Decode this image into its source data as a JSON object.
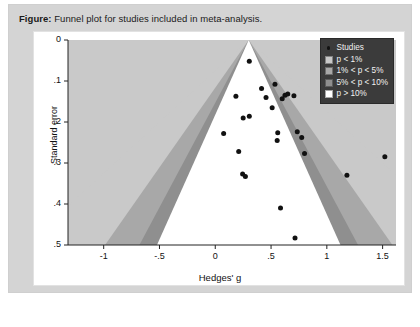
{
  "caption": {
    "label": "Figure:",
    "text": " Funnel plot for studies included in meta-analysis."
  },
  "colors": {
    "card_background": "#d4d4d4",
    "panel_background": "#ffffff",
    "band_p_lt_1": "#c9c9c9",
    "band_1_to_5": "#a8a8a8",
    "band_5_to_10": "#8f8f8f",
    "band_p_gt_10": "#ffffff",
    "point": "#111111",
    "legend_background": "#3b3b3b",
    "axis": "#222222"
  },
  "legend": {
    "position": "top-right",
    "entries": [
      {
        "label": "Studies",
        "swatch": "marker"
      },
      {
        "label": "p < 1%",
        "swatch": "#c9c9c9"
      },
      {
        "label": "1% < p < 5%",
        "swatch": "#a8a8a8"
      },
      {
        "label": "5% < p < 10%",
        "swatch": "#8f8f8f"
      },
      {
        "label": "p > 10%",
        "swatch": "#ffffff"
      }
    ]
  },
  "chart_data": {
    "type": "scatter",
    "title": "Funnel plot for studies included in meta-analysis.",
    "xlabel": "Hedges' g",
    "ylabel": "Standard error",
    "xlim": [
      -1.32,
      1.62
    ],
    "ylim": [
      0,
      0.5
    ],
    "y_inverted": true,
    "grid": false,
    "xticks": [
      -1,
      -0.5,
      0,
      0.5,
      1,
      1.5
    ],
    "xticklabels": [
      "-1",
      "-.5",
      "0",
      ".5",
      "1",
      "1.5"
    ],
    "yticks": [
      0,
      0.1,
      0.2,
      0.3,
      0.4,
      0.5
    ],
    "yticklabels": [
      "0",
      ".1",
      ".2",
      ".3",
      ".4",
      ".5"
    ],
    "funnel": {
      "center_effect": 0.3,
      "apex_x": 0.3,
      "apex_y": 0,
      "bands": [
        {
          "name": "p > 10%",
          "z": 1.645,
          "fill": "#ffffff"
        },
        {
          "name": "5% < p < 10%",
          "z": 1.96,
          "fill": "#8f8f8f"
        },
        {
          "name": "1% < p < 5%",
          "z": 2.576,
          "fill": "#a8a8a8"
        },
        {
          "name": "p < 1%",
          "z": 4.0,
          "fill": "#c9c9c9"
        }
      ]
    },
    "series": [
      {
        "name": "Studies",
        "marker": "circle",
        "color": "#111111",
        "points": [
          {
            "x": 0.305,
            "y": 0.052
          },
          {
            "x": 0.415,
            "y": 0.118
          },
          {
            "x": 0.535,
            "y": 0.108
          },
          {
            "x": 0.185,
            "y": 0.137
          },
          {
            "x": 0.455,
            "y": 0.14
          },
          {
            "x": 0.625,
            "y": 0.135
          },
          {
            "x": 0.65,
            "y": 0.132
          },
          {
            "x": 0.705,
            "y": 0.136
          },
          {
            "x": 0.6,
            "y": 0.143
          },
          {
            "x": 0.51,
            "y": 0.165
          },
          {
            "x": 0.25,
            "y": 0.19
          },
          {
            "x": 0.305,
            "y": 0.186
          },
          {
            "x": 0.075,
            "y": 0.228
          },
          {
            "x": 0.56,
            "y": 0.226
          },
          {
            "x": 0.735,
            "y": 0.224
          },
          {
            "x": 0.775,
            "y": 0.238
          },
          {
            "x": 0.555,
            "y": 0.245
          },
          {
            "x": 0.21,
            "y": 0.272
          },
          {
            "x": 0.8,
            "y": 0.277
          },
          {
            "x": 1.52,
            "y": 0.285
          },
          {
            "x": 0.245,
            "y": 0.327
          },
          {
            "x": 0.27,
            "y": 0.333
          },
          {
            "x": 1.18,
            "y": 0.33
          },
          {
            "x": 0.585,
            "y": 0.41
          },
          {
            "x": 0.715,
            "y": 0.483
          }
        ]
      }
    ]
  }
}
